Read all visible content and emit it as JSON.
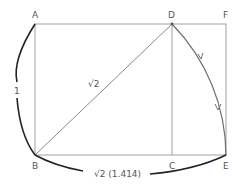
{
  "diagram": {
    "type": "geometric-construction",
    "points": {
      "A": {
        "label": "A",
        "x": 35,
        "y": 24
      },
      "D": {
        "label": "D",
        "x": 172,
        "y": 24
      },
      "F": {
        "label": "F",
        "x": 226,
        "y": 24
      },
      "B": {
        "label": "B",
        "x": 35,
        "y": 155
      },
      "C": {
        "label": "C",
        "x": 172,
        "y": 155
      },
      "E": {
        "label": "E",
        "x": 226,
        "y": 155
      }
    },
    "labels": {
      "side": "1",
      "diagonal": "√2",
      "base": "√2 (1.414)"
    },
    "colors": {
      "line": "#9a9a9a",
      "arc": "#6f6f6f",
      "bracket": "#222222",
      "text": "#555555"
    }
  }
}
